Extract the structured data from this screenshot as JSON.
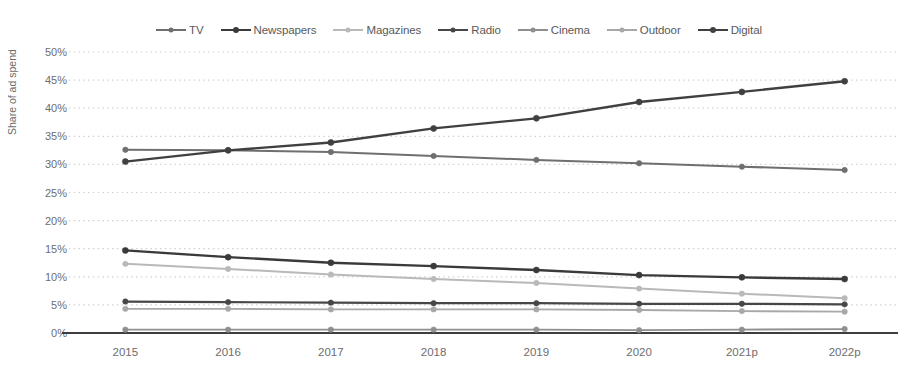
{
  "chart_data": {
    "type": "line",
    "title": "",
    "xlabel": "",
    "ylabel": "Share of ad spend",
    "categories": [
      "2015",
      "2016",
      "2017",
      "2018",
      "2019",
      "2020",
      "2021p",
      "2022p"
    ],
    "ylim": [
      0,
      50
    ],
    "ytick_labels": [
      "0%",
      "5%",
      "10%",
      "15%",
      "20%",
      "25%",
      "30%",
      "35%",
      "40%",
      "45%",
      "50%"
    ],
    "ytick_values": [
      0,
      5,
      10,
      15,
      20,
      25,
      30,
      35,
      40,
      45,
      50
    ],
    "ytick_suffix": "%",
    "grid": true,
    "grid_style": "dotted horizontal",
    "legend_position": "top-center",
    "series": [
      {
        "name": "TV",
        "color": "#6f6f6f",
        "width": 2.0,
        "marker": "circle",
        "values": [
          32.6,
          32.5,
          32.2,
          31.5,
          30.8,
          30.2,
          29.6,
          29.0
        ]
      },
      {
        "name": "Newspapers",
        "color": "#3a3a3a",
        "width": 2.4,
        "marker": "circle",
        "values": [
          14.7,
          13.5,
          12.5,
          11.9,
          11.2,
          10.3,
          9.9,
          9.6
        ]
      },
      {
        "name": "Magazines",
        "color": "#b9b9b9",
        "width": 2.0,
        "marker": "circle",
        "values": [
          12.3,
          11.4,
          10.4,
          9.6,
          8.9,
          7.9,
          7.0,
          6.2
        ]
      },
      {
        "name": "Radio",
        "color": "#474747",
        "width": 2.2,
        "marker": "circle",
        "values": [
          5.6,
          5.5,
          5.4,
          5.3,
          5.3,
          5.2,
          5.2,
          5.1
        ]
      },
      {
        "name": "Cinema",
        "color": "#8f8f8f",
        "width": 1.8,
        "marker": "circle",
        "values": [
          0.6,
          0.6,
          0.6,
          0.6,
          0.6,
          0.5,
          0.6,
          0.7
        ]
      },
      {
        "name": "Outdoor",
        "color": "#a8a8a8",
        "width": 1.9,
        "marker": "circle",
        "values": [
          4.3,
          4.3,
          4.2,
          4.2,
          4.2,
          4.1,
          3.9,
          3.8
        ]
      },
      {
        "name": "Digital",
        "color": "#404040",
        "width": 2.4,
        "marker": "circle",
        "values": [
          30.5,
          32.5,
          33.9,
          36.4,
          38.2,
          41.1,
          42.9,
          44.8
        ]
      }
    ]
  },
  "axis": {
    "y_title": "Share of ad spend"
  },
  "colors": {
    "background": "#ffffff",
    "gridline": "#d4d4d4",
    "axis_line": "#3d3d3d",
    "tick_text": "#6d6d6d"
  }
}
